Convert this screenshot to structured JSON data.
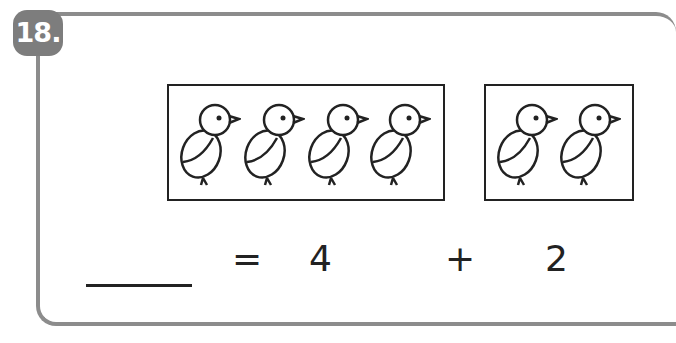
{
  "problem": {
    "number_label": "18.",
    "group1": {
      "count": 4,
      "item": "chick-icon"
    },
    "group2": {
      "count": 2,
      "item": "chick-icon"
    },
    "equation": {
      "answer_blank": "",
      "equals": "=",
      "addend1": "4",
      "plus": "+",
      "addend2": "2"
    }
  },
  "colors": {
    "frame": "#8c8c8c",
    "badge": "#7d7d7d",
    "ink": "#222222"
  }
}
